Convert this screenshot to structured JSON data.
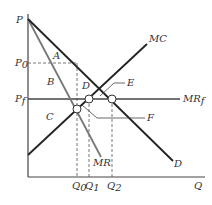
{
  "diagram": {
    "title": "",
    "colors": {
      "axis": "#444444",
      "demand": "#222222",
      "mr": "#777777",
      "mc": "#222222",
      "mrf": "#444444",
      "dashed": "#666666",
      "label": "#333333"
    },
    "axes": {
      "y_label": "P",
      "x_label": "Q"
    },
    "price_labels": {
      "p0": "P",
      "p0_sub": "0",
      "pf": "P",
      "pf_sub": "f"
    },
    "quantity_labels": {
      "q0": "Q",
      "q0_sub": "0",
      "q1": "Q",
      "q1_sub": "1",
      "q2": "Q",
      "q2_sub": "2"
    },
    "curves": {
      "demand": "D",
      "mr": "MR",
      "mc": "MC",
      "mrf": "MR",
      "mrf_sub": "f"
    },
    "areas": {
      "a": "A",
      "b": "B",
      "c": "C",
      "d": "D",
      "e": "E",
      "f": "F"
    }
  }
}
